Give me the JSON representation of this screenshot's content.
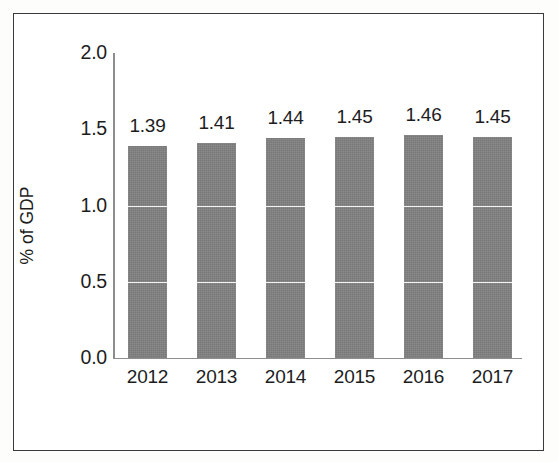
{
  "chart_data": {
    "type": "bar",
    "title": "",
    "subtitle": "",
    "xlabel": "",
    "ylabel": "% of GDP",
    "categories": [
      "2012",
      "2013",
      "2014",
      "2015",
      "2016",
      "2017"
    ],
    "values": [
      1.39,
      1.41,
      1.44,
      1.45,
      1.46,
      1.45
    ],
    "data_labels": [
      "1.39",
      "1.41",
      "1.44",
      "1.45",
      "1.46",
      "1.45"
    ],
    "ylim": [
      0.0,
      2.0
    ],
    "y_ticks": [
      2.0,
      1.5,
      1.0,
      0.5,
      0.0
    ],
    "y_tick_labels": [
      "2.0",
      "1.5",
      "1.0",
      "0.5",
      "0.0"
    ],
    "gridlines_on_bars": [
      0.5,
      1.0
    ],
    "grid": false,
    "legend": false,
    "legend_position": "none",
    "series": [
      {
        "name": "% of GDP",
        "values": [
          1.39,
          1.41,
          1.44,
          1.45,
          1.46,
          1.45
        ]
      }
    ],
    "colors": {
      "bar": "#808080",
      "bar_gridline": "#f2f2f2",
      "axis": "#8d8d8d",
      "text": "#1d1d1d",
      "frame_border": "#3a3a3a",
      "background": "#ffffff"
    }
  }
}
